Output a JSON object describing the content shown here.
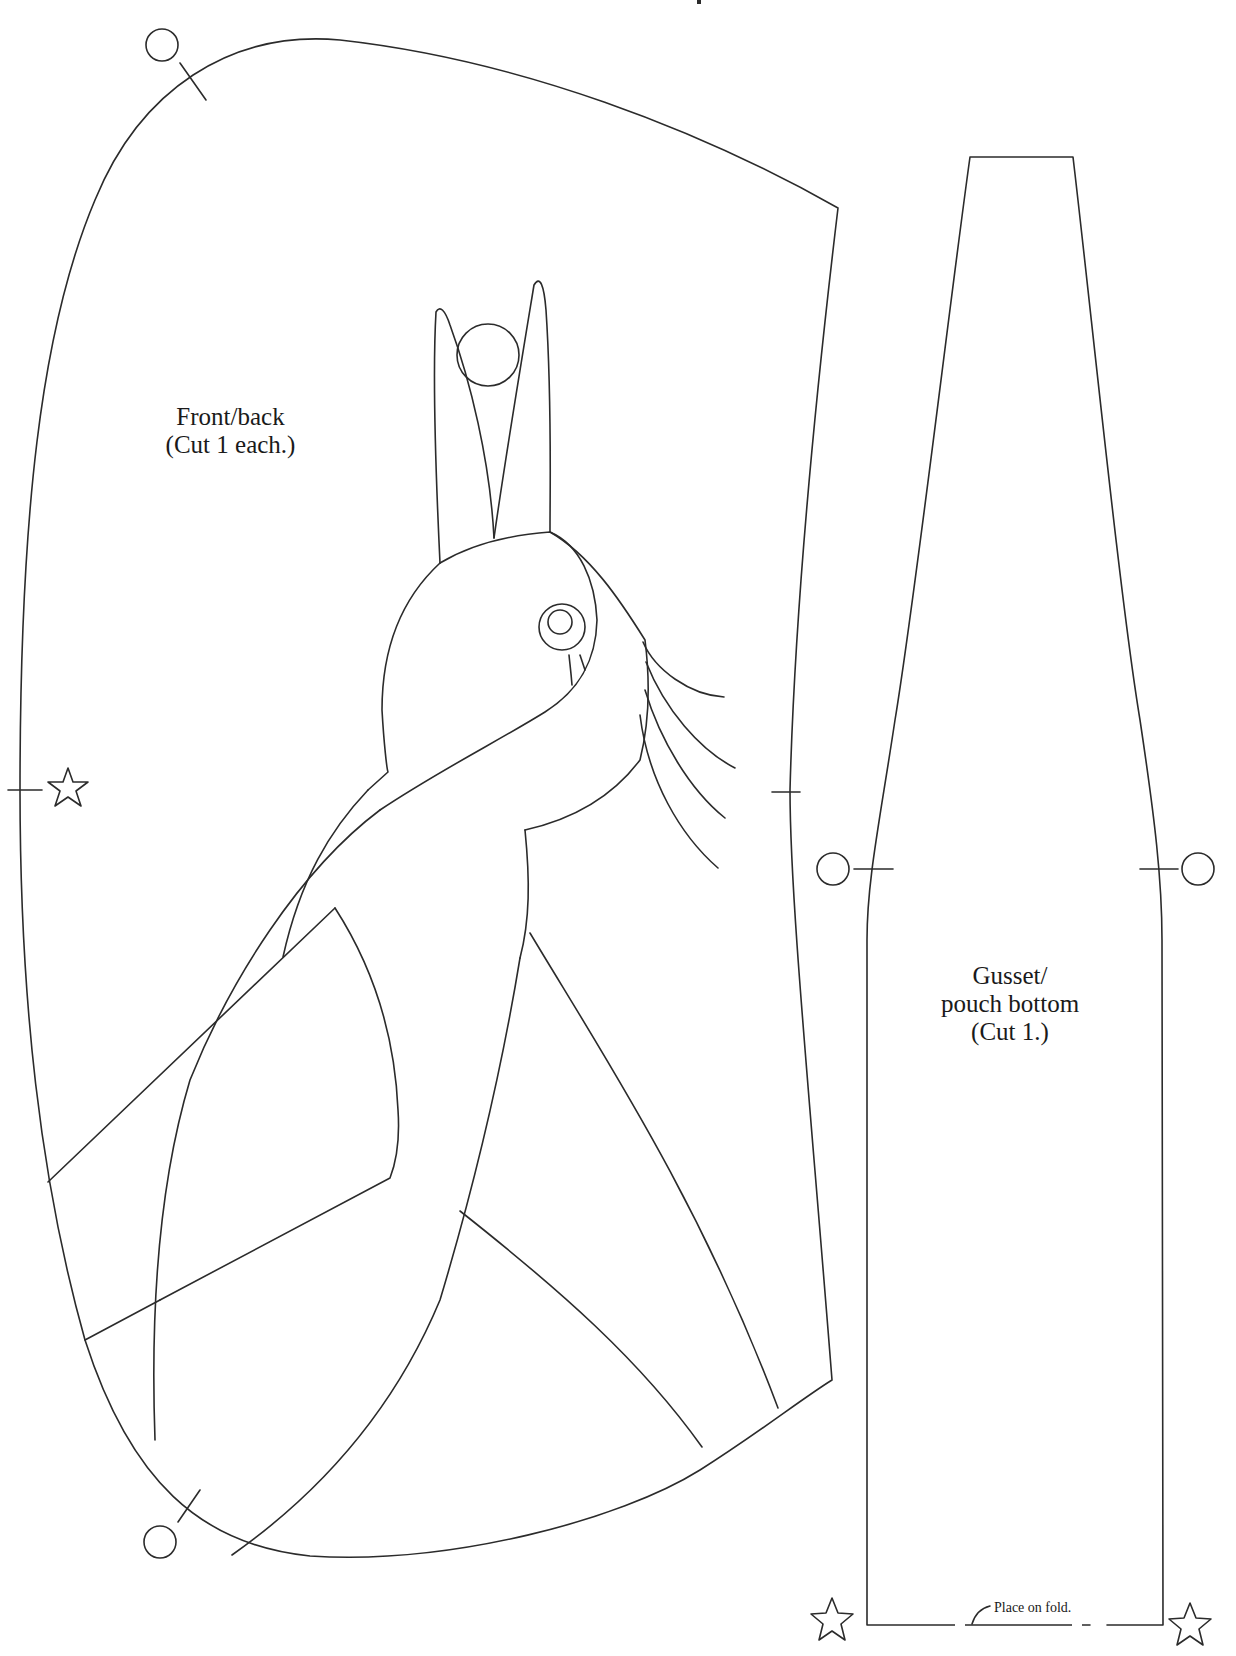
{
  "pieces": {
    "front_back": {
      "label_line1": "Front/back",
      "label_line2": "(Cut 1 each.)"
    },
    "gusset": {
      "label_line1": "Gusset/",
      "label_line2": "pouch bottom",
      "label_line3": "(Cut 1.)",
      "fold_note": "Place on fold."
    }
  },
  "markers": {
    "circle_marks": 5,
    "star_marks": 3,
    "notches": 6
  },
  "colors": {
    "line": "#2b2b2b",
    "background": "#ffffff",
    "text": "#1a1a1a"
  }
}
